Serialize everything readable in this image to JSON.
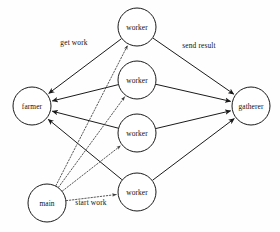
{
  "diagram": {
    "type": "node-link-graph",
    "canvas": {
      "width": 280,
      "height": 232,
      "background": "#ffffff"
    },
    "style": {
      "node_fill": "#ffffff",
      "node_stroke": "#1a1a1a",
      "solid_edge_color": "#1a1a1a",
      "dotted_edge_color": "#3a3a3a",
      "text_color": "#111111"
    },
    "nodes": [
      {
        "id": "farmer",
        "label": "farmer",
        "cx": 32,
        "cy": 106,
        "r": 19
      },
      {
        "id": "worker1",
        "label": "worker",
        "cx": 137,
        "cy": 27,
        "r": 19
      },
      {
        "id": "worker2",
        "label": "worker",
        "cx": 137,
        "cy": 80,
        "r": 19
      },
      {
        "id": "worker3",
        "label": "worker",
        "cx": 137,
        "cy": 133,
        "r": 19
      },
      {
        "id": "worker4",
        "label": "worker",
        "cx": 137,
        "cy": 192,
        "r": 19
      },
      {
        "id": "gatherer",
        "label": "gatherer",
        "cx": 251,
        "cy": 106,
        "r": 19
      },
      {
        "id": "main",
        "label": "main",
        "cx": 47,
        "cy": 203,
        "r": 19
      }
    ],
    "edges": [
      {
        "id": "w1-farmer",
        "from": "worker1",
        "to": "farmer",
        "style": "solid",
        "arrow": "end"
      },
      {
        "id": "w2-farmer",
        "from": "worker2",
        "to": "farmer",
        "style": "solid",
        "arrow": "end"
      },
      {
        "id": "w3-farmer",
        "from": "worker3",
        "to": "farmer",
        "style": "solid",
        "arrow": "end"
      },
      {
        "id": "w4-farmer",
        "from": "worker4",
        "to": "farmer",
        "style": "solid",
        "arrow": "end"
      },
      {
        "id": "w1-gatherer",
        "from": "worker1",
        "to": "gatherer",
        "style": "solid",
        "arrow": "end"
      },
      {
        "id": "w2-gatherer",
        "from": "worker2",
        "to": "gatherer",
        "style": "solid",
        "arrow": "end"
      },
      {
        "id": "w3-gatherer",
        "from": "worker3",
        "to": "gatherer",
        "style": "solid",
        "arrow": "end"
      },
      {
        "id": "w4-gatherer",
        "from": "worker4",
        "to": "gatherer",
        "style": "solid",
        "arrow": "end"
      },
      {
        "id": "main-w1",
        "from": "main",
        "to": "worker1",
        "style": "dotted",
        "arrow": "end"
      },
      {
        "id": "main-w2",
        "from": "main",
        "to": "worker2",
        "style": "dotted",
        "arrow": "end"
      },
      {
        "id": "main-w3",
        "from": "main",
        "to": "worker3",
        "style": "dotted",
        "arrow": "end"
      },
      {
        "id": "main-w4",
        "from": "main",
        "to": "worker4",
        "style": "dotted",
        "arrow": "end"
      }
    ],
    "edge_labels": [
      {
        "id": "get-work",
        "text": "get work",
        "x": 74,
        "y": 42,
        "for_edge": "w1-farmer"
      },
      {
        "id": "send-result",
        "text": "send result",
        "x": 199,
        "y": 45,
        "for_edge": "w1-gatherer"
      },
      {
        "id": "start-work",
        "text": "start work",
        "x": 91,
        "y": 202,
        "for_edge": "main-w4"
      }
    ]
  }
}
